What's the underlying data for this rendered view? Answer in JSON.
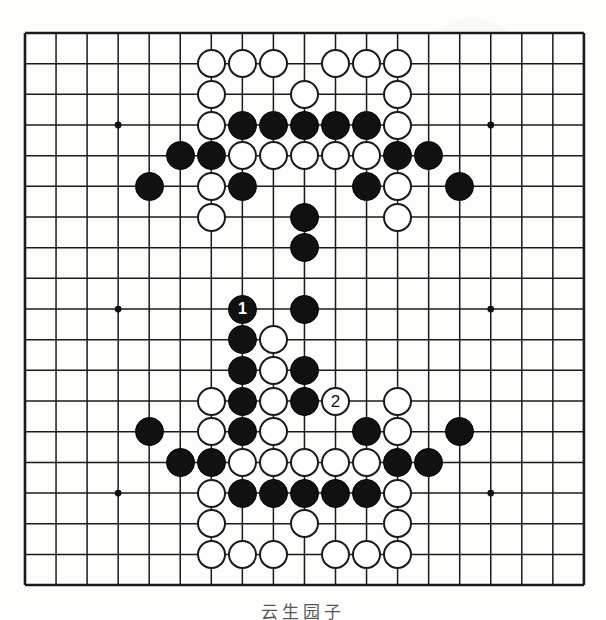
{
  "diagram": {
    "kind": "go-board-problem-diagram",
    "board_size": 19,
    "caption": "云生园子",
    "grid": {
      "origin_x": 25,
      "origin_y": 33,
      "step_x": 31.05,
      "step_y": 30.67,
      "line_color": "#1a1a1a",
      "border_color": "#111111",
      "background": "#fdfdfb",
      "star_points": [
        [
          3,
          3
        ],
        [
          9,
          3
        ],
        [
          15,
          3
        ],
        [
          3,
          9
        ],
        [
          9,
          9
        ],
        [
          15,
          9
        ],
        [
          3,
          15
        ],
        [
          9,
          15
        ],
        [
          15,
          15
        ]
      ]
    },
    "colors": {
      "black_stone": "#111111",
      "white_stone": "#ffffff",
      "stone_outline": "#1a1a1a",
      "label_on_black": "#ffffff",
      "label_on_white": "#111111"
    },
    "stone_radius": 14.5,
    "stones": [
      {
        "col": 6,
        "row": 1,
        "color": "white",
        "label": ""
      },
      {
        "col": 7,
        "row": 1,
        "color": "white",
        "label": ""
      },
      {
        "col": 8,
        "row": 1,
        "color": "white",
        "label": ""
      },
      {
        "col": 10,
        "row": 1,
        "color": "white",
        "label": ""
      },
      {
        "col": 11,
        "row": 1,
        "color": "white",
        "label": ""
      },
      {
        "col": 12,
        "row": 1,
        "color": "white",
        "label": ""
      },
      {
        "col": 6,
        "row": 2,
        "color": "white",
        "label": ""
      },
      {
        "col": 9,
        "row": 2,
        "color": "white",
        "label": ""
      },
      {
        "col": 12,
        "row": 2,
        "color": "white",
        "label": ""
      },
      {
        "col": 6,
        "row": 3,
        "color": "white",
        "label": ""
      },
      {
        "col": 7,
        "row": 3,
        "color": "black",
        "label": ""
      },
      {
        "col": 8,
        "row": 3,
        "color": "black",
        "label": ""
      },
      {
        "col": 9,
        "row": 3,
        "color": "black",
        "label": ""
      },
      {
        "col": 10,
        "row": 3,
        "color": "black",
        "label": ""
      },
      {
        "col": 11,
        "row": 3,
        "color": "black",
        "label": ""
      },
      {
        "col": 12,
        "row": 3,
        "color": "white",
        "label": ""
      },
      {
        "col": 5,
        "row": 4,
        "color": "black",
        "label": ""
      },
      {
        "col": 6,
        "row": 4,
        "color": "black",
        "label": ""
      },
      {
        "col": 7,
        "row": 4,
        "color": "white",
        "label": ""
      },
      {
        "col": 8,
        "row": 4,
        "color": "white",
        "label": ""
      },
      {
        "col": 9,
        "row": 4,
        "color": "white",
        "label": ""
      },
      {
        "col": 10,
        "row": 4,
        "color": "white",
        "label": ""
      },
      {
        "col": 11,
        "row": 4,
        "color": "white",
        "label": ""
      },
      {
        "col": 12,
        "row": 4,
        "color": "black",
        "label": ""
      },
      {
        "col": 13,
        "row": 4,
        "color": "black",
        "label": ""
      },
      {
        "col": 4,
        "row": 5,
        "color": "black",
        "label": ""
      },
      {
        "col": 6,
        "row": 5,
        "color": "white",
        "label": ""
      },
      {
        "col": 7,
        "row": 5,
        "color": "black",
        "label": ""
      },
      {
        "col": 11,
        "row": 5,
        "color": "black",
        "label": ""
      },
      {
        "col": 12,
        "row": 5,
        "color": "white",
        "label": ""
      },
      {
        "col": 14,
        "row": 5,
        "color": "black",
        "label": ""
      },
      {
        "col": 6,
        "row": 6,
        "color": "white",
        "label": ""
      },
      {
        "col": 9,
        "row": 6,
        "color": "black",
        "label": ""
      },
      {
        "col": 12,
        "row": 6,
        "color": "white",
        "label": ""
      },
      {
        "col": 9,
        "row": 7,
        "color": "black",
        "label": ""
      },
      {
        "col": 7,
        "row": 9,
        "color": "black",
        "label": "1"
      },
      {
        "col": 9,
        "row": 9,
        "color": "black",
        "label": ""
      },
      {
        "col": 7,
        "row": 10,
        "color": "black",
        "label": ""
      },
      {
        "col": 8,
        "row": 10,
        "color": "white",
        "label": ""
      },
      {
        "col": 7,
        "row": 11,
        "color": "black",
        "label": ""
      },
      {
        "col": 8,
        "row": 11,
        "color": "white",
        "label": ""
      },
      {
        "col": 9,
        "row": 11,
        "color": "black",
        "label": ""
      },
      {
        "col": 6,
        "row": 12,
        "color": "white",
        "label": ""
      },
      {
        "col": 7,
        "row": 12,
        "color": "black",
        "label": ""
      },
      {
        "col": 8,
        "row": 12,
        "color": "white",
        "label": ""
      },
      {
        "col": 9,
        "row": 12,
        "color": "black",
        "label": ""
      },
      {
        "col": 10,
        "row": 12,
        "color": "white",
        "label": "2"
      },
      {
        "col": 12,
        "row": 12,
        "color": "white",
        "label": ""
      },
      {
        "col": 4,
        "row": 13,
        "color": "black",
        "label": ""
      },
      {
        "col": 6,
        "row": 13,
        "color": "white",
        "label": ""
      },
      {
        "col": 7,
        "row": 13,
        "color": "black",
        "label": ""
      },
      {
        "col": 8,
        "row": 13,
        "color": "white",
        "label": ""
      },
      {
        "col": 11,
        "row": 13,
        "color": "black",
        "label": ""
      },
      {
        "col": 12,
        "row": 13,
        "color": "white",
        "label": ""
      },
      {
        "col": 14,
        "row": 13,
        "color": "black",
        "label": ""
      },
      {
        "col": 5,
        "row": 14,
        "color": "black",
        "label": ""
      },
      {
        "col": 6,
        "row": 14,
        "color": "black",
        "label": ""
      },
      {
        "col": 7,
        "row": 14,
        "color": "white",
        "label": ""
      },
      {
        "col": 8,
        "row": 14,
        "color": "white",
        "label": ""
      },
      {
        "col": 9,
        "row": 14,
        "color": "white",
        "label": ""
      },
      {
        "col": 10,
        "row": 14,
        "color": "white",
        "label": ""
      },
      {
        "col": 11,
        "row": 14,
        "color": "white",
        "label": ""
      },
      {
        "col": 12,
        "row": 14,
        "color": "black",
        "label": ""
      },
      {
        "col": 13,
        "row": 14,
        "color": "black",
        "label": ""
      },
      {
        "col": 6,
        "row": 15,
        "color": "white",
        "label": ""
      },
      {
        "col": 7,
        "row": 15,
        "color": "black",
        "label": ""
      },
      {
        "col": 8,
        "row": 15,
        "color": "black",
        "label": ""
      },
      {
        "col": 9,
        "row": 15,
        "color": "black",
        "label": ""
      },
      {
        "col": 10,
        "row": 15,
        "color": "black",
        "label": ""
      },
      {
        "col": 11,
        "row": 15,
        "color": "black",
        "label": ""
      },
      {
        "col": 12,
        "row": 15,
        "color": "white",
        "label": ""
      },
      {
        "col": 6,
        "row": 16,
        "color": "white",
        "label": ""
      },
      {
        "col": 9,
        "row": 16,
        "color": "white",
        "label": ""
      },
      {
        "col": 12,
        "row": 16,
        "color": "white",
        "label": ""
      },
      {
        "col": 6,
        "row": 17,
        "color": "white",
        "label": ""
      },
      {
        "col": 7,
        "row": 17,
        "color": "white",
        "label": ""
      },
      {
        "col": 8,
        "row": 17,
        "color": "white",
        "label": ""
      },
      {
        "col": 10,
        "row": 17,
        "color": "white",
        "label": ""
      },
      {
        "col": 11,
        "row": 17,
        "color": "white",
        "label": ""
      },
      {
        "col": 12,
        "row": 17,
        "color": "white",
        "label": ""
      }
    ],
    "move_markers": [
      {
        "number": "1",
        "color": "black",
        "col": 7,
        "row": 9
      },
      {
        "number": "2",
        "color": "white",
        "col": 10,
        "row": 12
      }
    ]
  }
}
